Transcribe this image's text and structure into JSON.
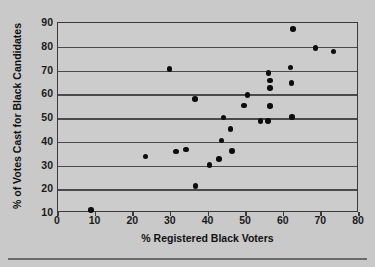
{
  "chart_data": {
    "type": "scatter",
    "title": "",
    "xlabel": "% Registered Black Voters",
    "ylabel": "% of Votes Cast for Black Candidates",
    "xlim": [
      0,
      80
    ],
    "ylim": [
      10,
      90
    ],
    "xticks": [
      0,
      10,
      20,
      30,
      40,
      50,
      60,
      70,
      80
    ],
    "yticks": [
      10,
      20,
      30,
      40,
      50,
      60,
      70,
      80,
      90
    ],
    "xtick_labels": [
      "0",
      "10",
      "20",
      "30",
      "40",
      "50",
      "60",
      "70",
      "80"
    ],
    "ytick_labels": [
      "10",
      "20",
      "30",
      "40",
      "50",
      "60",
      "70",
      "80",
      "90"
    ],
    "grid": "horizontal",
    "legend": "none",
    "marker": "filled-circle",
    "marker_color": "#0d0d0d",
    "points": [
      {
        "x": 8.8,
        "y": 11.3
      },
      {
        "x": 23.2,
        "y": 33.8
      },
      {
        "x": 29.6,
        "y": 70.7
      },
      {
        "x": 31.4,
        "y": 35.8
      },
      {
        "x": 34.0,
        "y": 36.8
      },
      {
        "x": 36.4,
        "y": 58.0
      },
      {
        "x": 36.6,
        "y": 21.3
      },
      {
        "x": 40.2,
        "y": 30.3
      },
      {
        "x": 42.8,
        "y": 32.7
      },
      {
        "x": 43.4,
        "y": 40.6
      },
      {
        "x": 44.0,
        "y": 50.2
      },
      {
        "x": 45.8,
        "y": 45.3
      },
      {
        "x": 46.2,
        "y": 36.2
      },
      {
        "x": 49.4,
        "y": 55.2
      },
      {
        "x": 50.4,
        "y": 59.7
      },
      {
        "x": 53.8,
        "y": 48.7
      },
      {
        "x": 55.8,
        "y": 48.7
      },
      {
        "x": 56.0,
        "y": 69.0
      },
      {
        "x": 56.4,
        "y": 65.8
      },
      {
        "x": 56.4,
        "y": 62.7
      },
      {
        "x": 56.4,
        "y": 55.0
      },
      {
        "x": 61.8,
        "y": 71.2
      },
      {
        "x": 62.0,
        "y": 64.7
      },
      {
        "x": 62.2,
        "y": 50.5
      },
      {
        "x": 62.4,
        "y": 87.5
      },
      {
        "x": 68.4,
        "y": 79.5
      },
      {
        "x": 73.2,
        "y": 78.0
      }
    ]
  },
  "colors": {
    "background": "#c9c9c9",
    "plot_background": "#cccccc",
    "axis": "#3a3a3a",
    "gridline": "#4a4a4a",
    "marker": "#0d0d0d",
    "text": "#111111"
  }
}
